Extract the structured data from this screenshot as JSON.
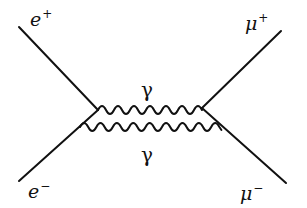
{
  "diagram": {
    "type": "feynman",
    "title": "",
    "stroke_color": "#111111",
    "particles": {
      "e_plus": {
        "symbol": "e",
        "charge": "+"
      },
      "e_minus": {
        "symbol": "e",
        "charge": "−"
      },
      "mu_plus": {
        "symbol": "μ",
        "charge": "+"
      },
      "mu_minus": {
        "symbol": "μ",
        "charge": "−"
      }
    },
    "photons": [
      {
        "label": "γ"
      },
      {
        "label": "γ"
      }
    ],
    "edges": [
      {
        "from": "e+",
        "to": "vertex-upper-left",
        "kind": "fermion"
      },
      {
        "from": "e-",
        "to": "vertex-upper-left",
        "kind": "fermion"
      },
      {
        "from": "vertex-upper-right",
        "to": "μ+",
        "kind": "fermion"
      },
      {
        "from": "vertex-upper-right",
        "to": "μ-",
        "kind": "fermion"
      },
      {
        "from": "vertex-upper-left",
        "to": "vertex-upper-right",
        "kind": "photon",
        "label": "γ"
      },
      {
        "from": "vertex-lower-left",
        "to": "vertex-lower-right",
        "kind": "photon",
        "label": "γ"
      }
    ]
  }
}
